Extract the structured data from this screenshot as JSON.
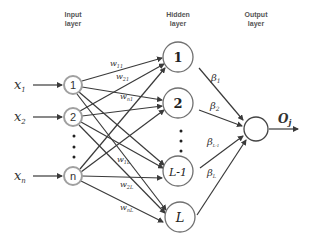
{
  "headers": {
    "input_line1": "Input",
    "input_line2": "layer",
    "hidden_line1": "Hidden",
    "hidden_line2": "layer",
    "output_line1": "Output",
    "output_line2": "layer"
  },
  "inputs": [
    {
      "var": "x",
      "sub": "1",
      "node": "1"
    },
    {
      "var": "x",
      "sub": "2",
      "node": "2"
    },
    {
      "var": "x",
      "sub": "n",
      "node": "n"
    }
  ],
  "hidden": [
    {
      "label": "1"
    },
    {
      "label": "2"
    },
    {
      "label": "L-1"
    },
    {
      "label": "L"
    }
  ],
  "weights": {
    "w11": {
      "base": "w",
      "sub": "11"
    },
    "w21": {
      "base": "w",
      "sub": "21"
    },
    "wn1": {
      "base": "w",
      "sub": "n1"
    },
    "w1L": {
      "base": "w",
      "sub": "1L"
    },
    "w2L": {
      "base": "w",
      "sub": "2L"
    },
    "wnL": {
      "base": "w",
      "sub": "nL"
    }
  },
  "betas": [
    {
      "base": "β",
      "sub": "1"
    },
    {
      "base": "β",
      "sub": "2"
    },
    {
      "base": "β",
      "sub": "L-1"
    },
    {
      "base": "β",
      "sub": "L"
    }
  ],
  "output": {
    "base": "O",
    "sub": "j"
  },
  "colors": {
    "input_node_stroke": "#a0a0a0",
    "hidden_node_stroke": "#707070",
    "edge": "#3a3a3a"
  }
}
